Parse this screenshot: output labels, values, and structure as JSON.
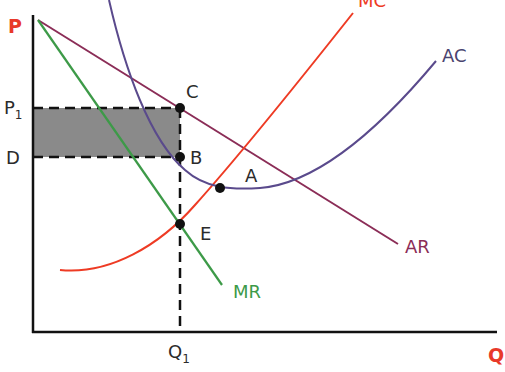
{
  "diagram": {
    "axes": {
      "y_label": "P",
      "x_label": "Q",
      "label_color": "#e8392a"
    },
    "curves": [
      {
        "name": "AR",
        "label": "AR",
        "color": "#8b2d57"
      },
      {
        "name": "MR",
        "label": "MR",
        "color": "#3d9a48"
      },
      {
        "name": "MC",
        "label": "MC",
        "color": "#ee3b24"
      },
      {
        "name": "AC",
        "label": "AC",
        "color": "#5a4a8c"
      }
    ],
    "price_labels": {
      "p1": {
        "main": "P",
        "sub": "1"
      },
      "d": "D"
    },
    "quantity_label": {
      "main": "Q",
      "sub": "1"
    },
    "points": [
      {
        "label": "C"
      },
      {
        "label": "B"
      },
      {
        "label": "A"
      },
      {
        "label": "E"
      }
    ],
    "shaded_region": {
      "description": "Supernormal profit",
      "color": "#8a8a8a"
    }
  }
}
